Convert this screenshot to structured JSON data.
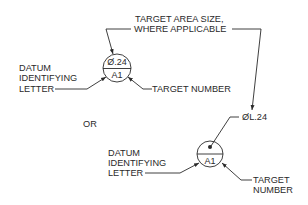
{
  "diagram": {
    "type": "datum target symbol callouts",
    "top_callout": {
      "target_area_label_line1": "TARGET AREA SIZE,",
      "target_area_label_line2": "WHERE APPLICABLE",
      "symbol": {
        "upper_text": "Ø.24",
        "lower_text": "A1"
      },
      "datum_label_line1": "DATUM",
      "datum_label_line2": "IDENTIFYING",
      "datum_label_line3": "LETTER",
      "target_number_label": "TARGET NUMBER"
    },
    "separator_text": "OR",
    "bottom_callout": {
      "size_text": "ØL.24",
      "symbol": {
        "upper_mark": "dot",
        "lower_text": "A1"
      },
      "datum_label_line1": "DATUM",
      "datum_label_line2": "IDENTIFYING",
      "datum_label_line3": "LETTER",
      "target_number_line1": "TARGET",
      "target_number_line2": "NUMBER"
    },
    "colors": {
      "ink": "#2a2a2a",
      "background": "#ffffff"
    }
  }
}
